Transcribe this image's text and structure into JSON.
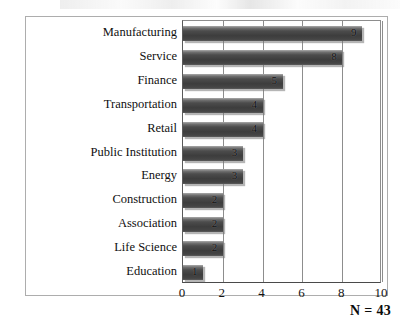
{
  "chart_data": {
    "type": "bar",
    "orientation": "horizontal",
    "title": "",
    "xlabel": "",
    "ylabel": "",
    "categories": [
      "Manufacturing",
      "Service",
      "Finance",
      "Transportation",
      "Retail",
      "Public Institution",
      "Energy",
      "Construction",
      "Association",
      "Life Science",
      "Education"
    ],
    "values": [
      9,
      8,
      5,
      4,
      4,
      3,
      3,
      2,
      2,
      2,
      1
    ],
    "value_labels": [
      "9",
      "8",
      "5",
      "4",
      "4",
      "3",
      "3",
      "2",
      "2",
      "2",
      "1"
    ],
    "xlim": [
      0,
      10
    ],
    "xticks": [
      0,
      2,
      4,
      6,
      8,
      10
    ],
    "xtick_labels": [
      "0",
      "2",
      "4",
      "6",
      "8",
      "10"
    ],
    "grid": "vertical",
    "legend": "none",
    "bar_color": "#444444",
    "annotation": "N = 43"
  },
  "annotations": {
    "sample_size": "N = 43"
  }
}
